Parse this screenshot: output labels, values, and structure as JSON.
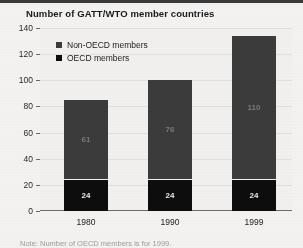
{
  "chart_data": {
    "type": "bar",
    "subtype": "stacked-column",
    "title": "Number of GATT/WTO member countries",
    "xlabel": "",
    "ylabel": "",
    "categories": [
      "1980",
      "1990",
      "1999"
    ],
    "series": [
      {
        "name": "OECD members",
        "values": [
          24,
          24,
          24
        ],
        "color": "#0d0d0d"
      },
      {
        "name": "Non-OECD members",
        "values": [
          61,
          76,
          110
        ],
        "color": "#3b3b3b"
      }
    ],
    "totals": [
      85,
      100,
      134
    ],
    "ylim": [
      0,
      140
    ],
    "yticks": [
      0,
      20,
      40,
      60,
      80,
      100,
      120,
      140
    ],
    "ytick_labels": [
      "0",
      "20",
      "40",
      "60",
      "80",
      "100",
      "120",
      "140"
    ],
    "grid": true,
    "legend_position": "top-left",
    "data_labels": {
      "non_oecd": [
        "61",
        "76",
        "110"
      ],
      "oecd": [
        "24",
        "24",
        "24"
      ]
    },
    "note": "Note: Number of OECD members is for 1999."
  },
  "legend": {
    "items": [
      {
        "label": "Non-OECD members",
        "swatch": "legend-swatch-nonoecd",
        "color": "#3b3b3b"
      },
      {
        "label": "OECD members",
        "swatch": "legend-swatch-oecd",
        "color": "#0d0d0d"
      }
    ]
  }
}
